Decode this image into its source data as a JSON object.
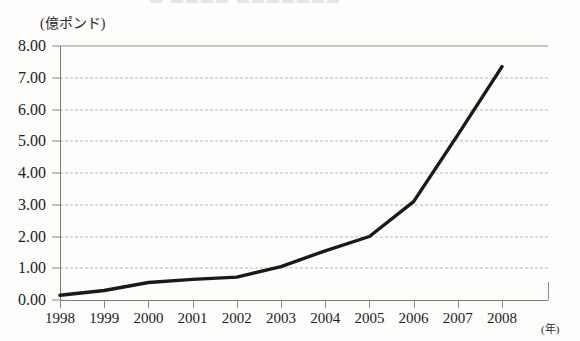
{
  "figure": {
    "title_remnant": "▬ ▬▬▬▬ ▬▬▬▬▬▬▬",
    "y_unit_label": "(億ポンド)",
    "x_unit_label": "(年)",
    "line_color": "#1a1a16",
    "grid_color": "#b9b9ae",
    "axis_color": "#7c7c72"
  },
  "chart_data": {
    "type": "line",
    "title": "",
    "xlabel": "(年)",
    "ylabel": "(億ポンド)",
    "categories": [
      "1998",
      "1999",
      "2000",
      "2001",
      "2002",
      "2003",
      "2004",
      "2005",
      "2006",
      "2007",
      "2008"
    ],
    "x": [
      1998,
      1999,
      2000,
      2001,
      2002,
      2003,
      2004,
      2005,
      2006,
      2007,
      2008
    ],
    "values": [
      0.15,
      0.3,
      0.55,
      0.65,
      0.72,
      1.05,
      1.55,
      2.0,
      3.1,
      5.2,
      7.35
    ],
    "series": [
      {
        "name": "金額",
        "values": [
          0.15,
          0.3,
          0.55,
          0.65,
          0.72,
          1.05,
          1.55,
          2.0,
          3.1,
          5.2,
          7.35
        ]
      }
    ],
    "ylim": [
      0.0,
      8.0
    ],
    "ytick_labels": [
      "0.00",
      "1.00",
      "2.00",
      "3.00",
      "4.00",
      "5.00",
      "6.00",
      "7.00",
      "8.00"
    ],
    "ytick_values": [
      0,
      1,
      2,
      3,
      4,
      5,
      6,
      7,
      8
    ],
    "xtick_labels": [
      "1998",
      "1999",
      "2000",
      "2001",
      "2002",
      "2003",
      "2004",
      "2005",
      "2006",
      "2007",
      "2008"
    ],
    "grid": true,
    "grid_axis": "y",
    "legend": false,
    "legend_position": "none",
    "markers": false
  }
}
